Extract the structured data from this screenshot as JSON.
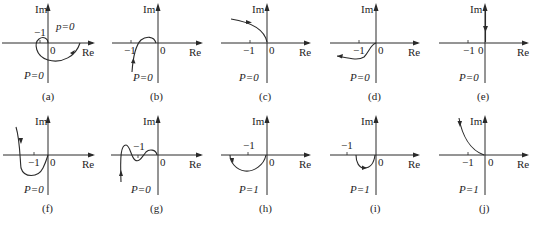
{
  "figure": {
    "axis_labels": {
      "im": "Im",
      "re": "Re",
      "origin": "0",
      "minus_one": "−1"
    },
    "panels": [
      {
        "id": "a",
        "caption": "(a)",
        "p_label": "P=0",
        "p_label_lower": "p=0"
      },
      {
        "id": "b",
        "caption": "(b)",
        "p_label": "P=0"
      },
      {
        "id": "c",
        "caption": "(c)",
        "p_label": "P=0"
      },
      {
        "id": "d",
        "caption": "(d)",
        "p_label": "P=0"
      },
      {
        "id": "e",
        "caption": "(e)",
        "p_label": "P=0"
      },
      {
        "id": "f",
        "caption": "(f)",
        "p_label": "P=0"
      },
      {
        "id": "g",
        "caption": "(g)",
        "p_label": "P=0"
      },
      {
        "id": "h",
        "caption": "(h)",
        "p_label": "P=1"
      },
      {
        "id": "i",
        "caption": "(i)",
        "p_label": "P=1"
      },
      {
        "id": "j",
        "caption": "(j)",
        "p_label": "P=1"
      }
    ]
  }
}
